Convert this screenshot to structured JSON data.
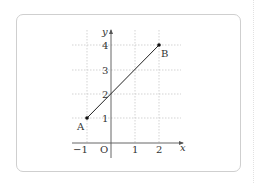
{
  "figure": {
    "x_axis_label": "x",
    "y_axis_label": "y",
    "origin_label": "O",
    "x_ticks": [
      "−1",
      "1",
      "2"
    ],
    "y_ticks": [
      "1",
      "2",
      "3",
      "4"
    ],
    "points": [
      {
        "label": "A",
        "x": -1,
        "y": 1
      },
      {
        "label": "B",
        "x": 2,
        "y": 4
      }
    ]
  }
}
